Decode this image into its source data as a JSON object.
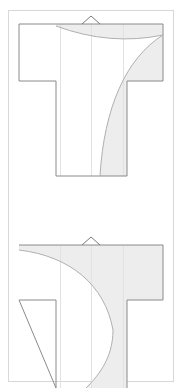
{
  "document": {
    "title": "Kimono Garment Pattern Diagram",
    "type": "technical-line-drawing",
    "canvas": {
      "width": 184,
      "height": 388
    },
    "background_color": "#ffffff"
  },
  "colors": {
    "page_background": "#ffffff",
    "frame_border": "#d8d8d8",
    "outline_stroke": "#8a8a8a",
    "light_guide_stroke": "#e2e2e2",
    "curve_stroke": "#b0b0b0",
    "shaded_fill": "#ededed",
    "garment_fill": "#ffffff"
  },
  "frame": {
    "name": "outer-page-frame",
    "x": 8,
    "y": 10,
    "width": 166,
    "height": 372,
    "stroke": "#d8d8d8",
    "stroke_width": 1,
    "fill": "none"
  },
  "figures": [
    {
      "id": "kimono-upper",
      "label": "Upper kimono pattern",
      "cropped": false,
      "shoulder_y": 24,
      "sleeve_bottom_y": 81,
      "hem_y": 176,
      "sleeve_left_x": 19,
      "sleeve_right_x": 163,
      "body_left_x": 56,
      "body_right_x": 127,
      "collar_notch": {
        "name": "collar-notch",
        "apex_x": 91,
        "apex_y": 16,
        "left_x": 82,
        "right_x": 100,
        "base_y": 24
      },
      "guide_lines_x": [
        60,
        91,
        123
      ],
      "shaded_region_description": "Shaded sweep along right side of body bounded by a concave curve from the collar area down to the hem.",
      "neck_curve": {
        "from_x": 56,
        "from_y": 26,
        "ctrl_x": 110,
        "ctrl_y": 46,
        "to_x": 163,
        "to_y": 35
      },
      "body_curve": {
        "from_x": 163,
        "from_y": 35,
        "c1_x": 126,
        "c1_y": 58,
        "c2_x": 104,
        "c2_y": 108,
        "to_x": 100,
        "to_y": 176
      }
    },
    {
      "id": "kimono-lower",
      "label": "Lower kimono pattern (cropped at page bottom)",
      "cropped": true,
      "shoulder_y": 245,
      "sleeve_bottom_y": 300,
      "hem_y": 388,
      "sleeve_left_x": 19,
      "sleeve_right_x": 163,
      "body_left_x": 56,
      "body_right_x": 127,
      "collar_notch": {
        "name": "collar-notch",
        "apex_x": 91,
        "apex_y": 237,
        "left_x": 82,
        "right_x": 100,
        "base_y": 245
      },
      "guide_lines_x": [
        60,
        91,
        123
      ],
      "shaded_region_description": "Large shaded sweep across the shoulder band and down the right body, bounded by a convex curve bulging to the right.",
      "shoulder_curve": {
        "from_x": 19,
        "from_y": 250,
        "c1_x": 70,
        "c1_y": 256,
        "c2_x": 105,
        "c2_y": 285,
        "to_x": 113,
        "to_y": 330
      },
      "body_curve": {
        "from_x": 113,
        "from_y": 330,
        "c1_x": 113,
        "c1_y": 360,
        "c2_x": 96,
        "c2_y": 378,
        "to_x": 86,
        "to_y": 388
      }
    }
  ],
  "annotations": {
    "visible_text": [],
    "note": "No text labels are rendered in this drawing."
  }
}
